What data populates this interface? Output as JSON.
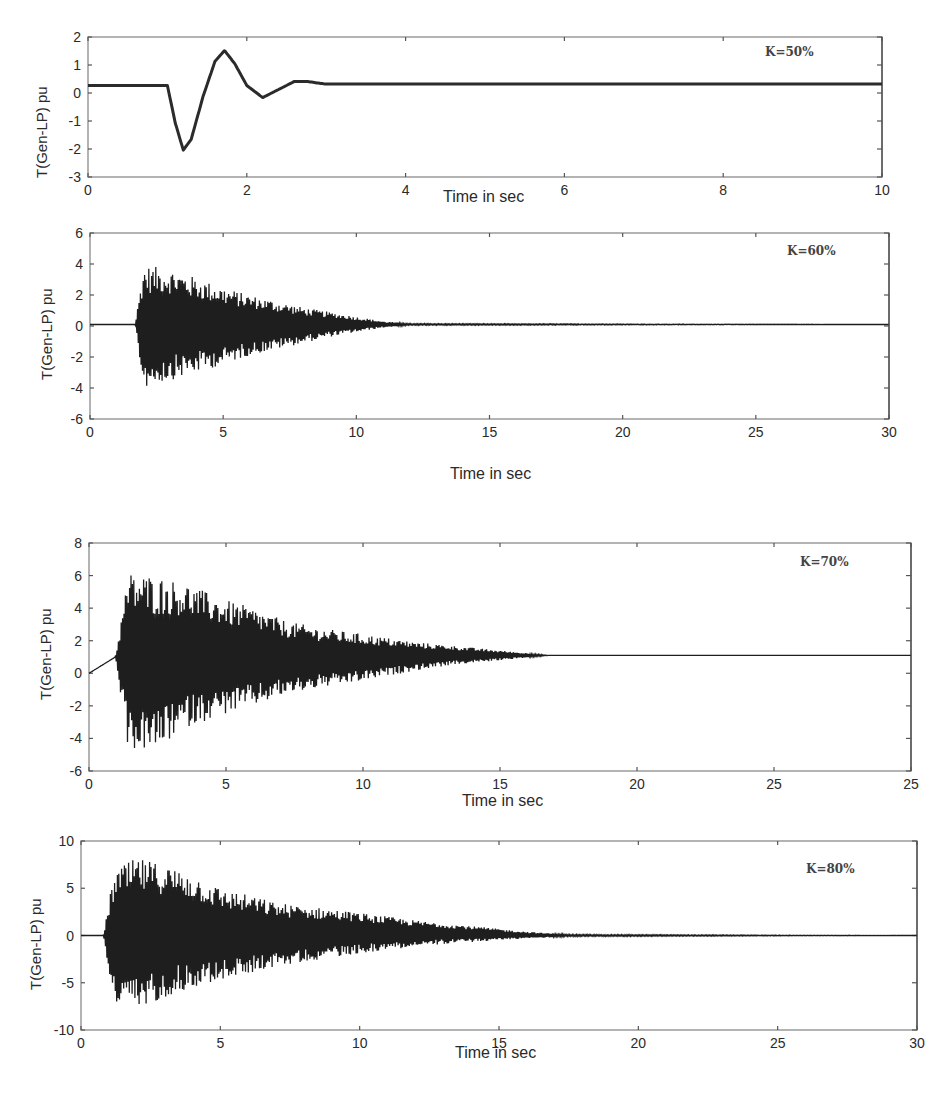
{
  "figure": {
    "panels": [
      {
        "id": "k50",
        "k_label": "K=50%",
        "ylabel": "T(Gen-LP) pu",
        "xlabel": "Time in sec",
        "xticks": [
          "0",
          "2",
          "4",
          "6",
          "8",
          "10"
        ],
        "yticks": [
          "2",
          "1",
          "0",
          "-1",
          "-2",
          "-3"
        ]
      },
      {
        "id": "k60",
        "k_label": "K=60%",
        "ylabel": "T(Gen-LP) pu",
        "xlabel": "Time in sec",
        "xticks": [
          "0",
          "5",
          "10",
          "15",
          "20",
          "25",
          "30"
        ],
        "yticks": [
          "6",
          "4",
          "2",
          "0",
          "-2",
          "-4",
          "-6"
        ]
      },
      {
        "id": "k70",
        "k_label": "K=70%",
        "ylabel": "T(Gen-LP) pu",
        "xlabel": "Time in sec",
        "xticks": [
          "0",
          "5",
          "10",
          "15",
          "20",
          "25",
          "25"
        ],
        "yticks": [
          "8",
          "6",
          "4",
          "2",
          "0",
          "-2",
          "-4",
          "-6"
        ]
      },
      {
        "id": "k80",
        "k_label": "K=80%",
        "ylabel": "T(Gen-LP) pu",
        "xlabel": "Time in sec",
        "xticks": [
          "0",
          "5",
          "10",
          "15",
          "20",
          "25",
          "30"
        ],
        "yticks": [
          "10",
          "5",
          "0",
          "-5",
          "-10"
        ]
      }
    ]
  },
  "chart_data": [
    {
      "type": "line",
      "title": "K=50%",
      "xlabel": "Time in sec",
      "ylabel": "T(Gen-LP) pu",
      "xlim": [
        0,
        10
      ],
      "ylim": [
        -3,
        2.2
      ],
      "grid": false,
      "x": [
        0,
        1.0,
        1.1,
        1.2,
        1.3,
        1.45,
        1.6,
        1.72,
        1.85,
        2.0,
        2.2,
        2.4,
        2.6,
        2.75,
        3.0,
        10
      ],
      "values": [
        0.4,
        0.4,
        -1.0,
        -2.0,
        -1.6,
        0.0,
        1.3,
        1.7,
        1.2,
        0.4,
        -0.05,
        0.25,
        0.55,
        0.55,
        0.45,
        0.45
      ]
    },
    {
      "type": "line",
      "title": "K=60%",
      "xlabel": "Time in sec",
      "ylabel": "T(Gen-LP) pu",
      "xlim": [
        0,
        30
      ],
      "ylim": [
        -6,
        6
      ],
      "grid": false,
      "description": "steady ~0.1 until t≈1.7s, then high-frequency oscillation with envelope peaks ~+3.9/-4.0 decaying to steady by t≈11.5s",
      "x": [
        0,
        1.7,
        2,
        3,
        4,
        5,
        6,
        7,
        8,
        9,
        10,
        11,
        12,
        30
      ],
      "upper_envelope": [
        0.1,
        0.1,
        3.9,
        3.7,
        3.1,
        2.5,
        2.0,
        1.6,
        1.2,
        0.9,
        0.6,
        0.3,
        0.15,
        0.1
      ],
      "lower_envelope": [
        0.1,
        0.1,
        -4.0,
        -3.5,
        -3.0,
        -2.5,
        -1.9,
        -1.5,
        -1.1,
        -0.7,
        -0.4,
        -0.1,
        0.05,
        0.1
      ]
    },
    {
      "type": "line",
      "title": "K=70%",
      "xlabel": "Time in sec",
      "ylabel": "T(Gen-LP) pu",
      "xlim": [
        0,
        25
      ],
      "ylim": [
        -6,
        8
      ],
      "grid": false,
      "description": "rises from 0 to ~1 by t≈0.8s, then oscillation with peaks ~+6.2/-4.8 decaying to steady ~1.1 by t≈14s",
      "x": [
        0,
        0.8,
        1.2,
        2,
        3,
        4,
        5,
        6,
        7,
        8,
        9,
        10,
        11,
        12,
        13,
        14,
        25
      ],
      "upper_envelope": [
        0,
        1.0,
        6.2,
        6.0,
        5.5,
        4.6,
        4.0,
        3.2,
        2.8,
        2.5,
        2.2,
        1.9,
        1.7,
        1.5,
        1.3,
        1.1,
        1.1
      ],
      "lower_envelope": [
        0,
        1.0,
        -4.7,
        -4.8,
        -3.3,
        -2.6,
        -2.0,
        -1.3,
        -0.9,
        -0.6,
        -0.2,
        0.2,
        0.5,
        0.7,
        0.9,
        1.1,
        1.1
      ]
    },
    {
      "type": "line",
      "title": "K=80%",
      "xlabel": "Time in sec",
      "ylabel": "T(Gen-LP) pu",
      "xlim": [
        0,
        30
      ],
      "ylim": [
        -10,
        10
      ],
      "grid": false,
      "description": "steady ~0 until t≈0.8s, then oscillation with peaks ~+8.2/-8.0 decaying to steady by t≈17.5s",
      "x": [
        0,
        0.8,
        1.2,
        2,
        3,
        4,
        5,
        6,
        7,
        8,
        9,
        10,
        11,
        12,
        13,
        14,
        15,
        16,
        17.5,
        30
      ],
      "upper_envelope": [
        0,
        0,
        7.0,
        8.2,
        7.5,
        6.5,
        5.0,
        4.3,
        3.5,
        3.1,
        2.8,
        2.4,
        2.0,
        1.6,
        1.3,
        1.0,
        0.7,
        0.4,
        0.1,
        0
      ],
      "lower_envelope": [
        0,
        0,
        -7.5,
        -8.0,
        -6.5,
        -5.5,
        -4.8,
        -4.0,
        -3.3,
        -2.8,
        -2.3,
        -1.9,
        -1.5,
        -1.2,
        -0.9,
        -0.7,
        -0.5,
        -0.3,
        -0.1,
        0
      ]
    }
  ]
}
